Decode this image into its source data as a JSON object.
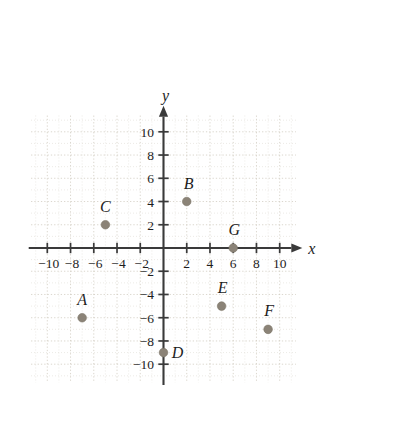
{
  "chart_data": {
    "type": "scatter",
    "title": "",
    "subtitle": "",
    "xlabel": "x",
    "ylabel": "y",
    "xlim": [
      -11.8,
      11.8
    ],
    "ylim": [
      -11.8,
      11.8
    ],
    "grid": true,
    "legend": "none",
    "x_ticks": [
      -10,
      -8,
      -6,
      -4,
      -2,
      2,
      4,
      6,
      8,
      10
    ],
    "y_ticks": [
      10,
      8,
      6,
      4,
      2,
      -2,
      -4,
      -6,
      -8,
      -10
    ],
    "x_tick_labels": [
      "−10",
      "−8",
      "−6",
      "−4",
      "−2",
      "2",
      "4",
      "6",
      "8",
      "10"
    ],
    "y_tick_labels": [
      "10",
      "8",
      "6",
      "4",
      "2",
      "−2",
      "−4",
      "−6",
      "−8",
      "−10"
    ],
    "tick_step": 2,
    "grid_step": 1,
    "points": [
      {
        "label": "A",
        "x": -7,
        "y": -6,
        "label_dx": 0,
        "label_dy": -13
      },
      {
        "label": "B",
        "x": 2,
        "y": 4,
        "label_dx": 2,
        "label_dy": -13
      },
      {
        "label": "C",
        "x": -5,
        "y": 2,
        "label_dx": 0,
        "label_dy": -13
      },
      {
        "label": "D",
        "x": 0,
        "y": -9,
        "label_dx": 14,
        "label_dy": 5
      },
      {
        "label": "E",
        "x": 5,
        "y": -5,
        "label_dx": 1,
        "label_dy": -13
      },
      {
        "label": "F",
        "x": 9,
        "y": -7,
        "label_dx": 1,
        "label_dy": -13
      },
      {
        "label": "G",
        "x": 6,
        "y": 0,
        "label_dx": 1,
        "label_dy": -13
      }
    ],
    "colors": {
      "point": "#8b8377",
      "axis": "#3a3a3a",
      "grid": "#d9d4cb",
      "text": "#1d1d1d",
      "background": "#ffffff"
    }
  }
}
